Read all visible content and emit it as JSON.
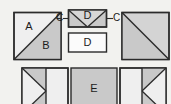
{
  "diagram": {
    "background_color": "#f2f2ef",
    "outline_color": "#2b2b2b",
    "colors": {
      "light": "#efefef",
      "mid_gray": "#c9c9c9",
      "dark_gray": "#bdbdbd",
      "white": "#fbfbfb",
      "text": "#1b1b1b"
    },
    "top_row": {
      "half_square_left": {
        "name": "half-square-triangle-AB",
        "labels": {
          "upper_left": "A",
          "lower_right": "B"
        },
        "diagonal": "bottom-left-to-top-right"
      },
      "flying_geese": {
        "name": "flying-geese-unit-D",
        "label": "D",
        "shape": "rectangle-with-V-seams"
      },
      "plain_rect": {
        "name": "plain-rectangle-D",
        "label": "D"
      },
      "half_square_right": {
        "name": "half-square-triangle-plain",
        "labels": {
          "upper_left": "",
          "lower_right": ""
        },
        "diagonal": "top-left-to-bottom-right"
      },
      "connector_left_label": "C",
      "connector_right_label": "C"
    },
    "bottom_row": {
      "left_unit": {
        "name": "triangle-right-unit",
        "label": ""
      },
      "center_unit": {
        "name": "square-E",
        "label": "E"
      },
      "right_unit": {
        "name": "triangle-left-unit",
        "label": ""
      }
    }
  }
}
